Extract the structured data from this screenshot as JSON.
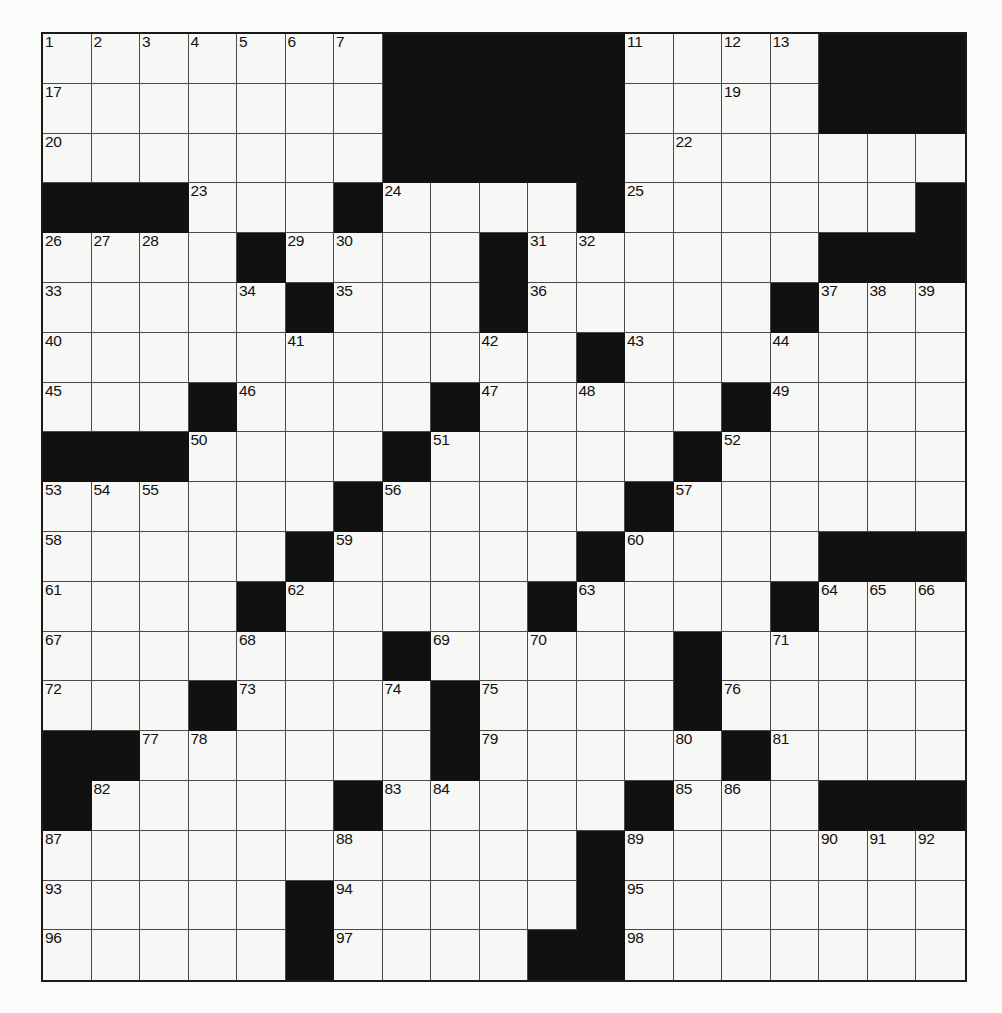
{
  "puzzle": {
    "title": "Crossword Grid",
    "type": "crossword-grid",
    "rows": 19,
    "cols": 19,
    "colors": {
      "block": "#111111",
      "cell": "#f7f7f5",
      "gridline": "#4a4a4a",
      "border": "#1a1a1a",
      "number": "#111111",
      "page_background": "#ffffff"
    },
    "blocks": [
      [
        7,
        8,
        9,
        10,
        11,
        16,
        17,
        18
      ],
      [
        7,
        8,
        9,
        10,
        11,
        16,
        17,
        18
      ],
      [
        7,
        8,
        9,
        10,
        11
      ],
      [
        0,
        1,
        2,
        6,
        11,
        18
      ],
      [
        4,
        9,
        16,
        17,
        18
      ],
      [
        5,
        9,
        15
      ],
      [
        11
      ],
      [
        3,
        8,
        14
      ],
      [
        0,
        1,
        2,
        7,
        13
      ],
      [
        6,
        12
      ],
      [
        5,
        11,
        16,
        17,
        18
      ],
      [
        4,
        10,
        15
      ],
      [
        7,
        13
      ],
      [
        3,
        8,
        13
      ],
      [
        0,
        1,
        8,
        14
      ],
      [
        0,
        6,
        12,
        16,
        17,
        18
      ],
      [
        11
      ],
      [
        5,
        11
      ],
      [
        5,
        10,
        11
      ]
    ],
    "numbers": [
      {
        "row": 0,
        "col": 0,
        "n": "1"
      },
      {
        "row": 0,
        "col": 1,
        "n": "2"
      },
      {
        "row": 0,
        "col": 2,
        "n": "3"
      },
      {
        "row": 0,
        "col": 3,
        "n": "4"
      },
      {
        "row": 0,
        "col": 4,
        "n": "5"
      },
      {
        "row": 0,
        "col": 5,
        "n": "6"
      },
      {
        "row": 0,
        "col": 6,
        "n": "7"
      },
      {
        "row": 0,
        "col": 9,
        "n": "8"
      },
      {
        "row": 0,
        "col": 10,
        "n": "9"
      },
      {
        "row": 0,
        "col": 11,
        "n": "10"
      },
      {
        "row": 0,
        "col": 12,
        "n": "11"
      },
      {
        "row": 0,
        "col": 14,
        "n": "12"
      },
      {
        "row": 0,
        "col": 15,
        "n": "13"
      },
      {
        "row": 0,
        "col": 16,
        "n": "14"
      },
      {
        "row": 0,
        "col": 17,
        "n": "15"
      },
      {
        "row": 0,
        "col": 18,
        "n": "16"
      },
      {
        "row": 1,
        "col": 0,
        "n": "17"
      },
      {
        "row": 1,
        "col": 9,
        "n": "18"
      },
      {
        "row": 1,
        "col": 14,
        "n": "19"
      },
      {
        "row": 2,
        "col": 0,
        "n": "20"
      },
      {
        "row": 2,
        "col": 9,
        "n": "21"
      },
      {
        "row": 2,
        "col": 13,
        "n": "22"
      },
      {
        "row": 3,
        "col": 3,
        "n": "23"
      },
      {
        "row": 3,
        "col": 7,
        "n": "24"
      },
      {
        "row": 3,
        "col": 12,
        "n": "25"
      },
      {
        "row": 4,
        "col": 0,
        "n": "26"
      },
      {
        "row": 4,
        "col": 1,
        "n": "27"
      },
      {
        "row": 4,
        "col": 2,
        "n": "28"
      },
      {
        "row": 4,
        "col": 5,
        "n": "29"
      },
      {
        "row": 4,
        "col": 6,
        "n": "30"
      },
      {
        "row": 4,
        "col": 10,
        "n": "31"
      },
      {
        "row": 4,
        "col": 11,
        "n": "32"
      },
      {
        "row": 5,
        "col": 0,
        "n": "33"
      },
      {
        "row": 5,
        "col": 4,
        "n": "34"
      },
      {
        "row": 5,
        "col": 6,
        "n": "35"
      },
      {
        "row": 5,
        "col": 10,
        "n": "36"
      },
      {
        "row": 5,
        "col": 16,
        "n": "37"
      },
      {
        "row": 5,
        "col": 17,
        "n": "38"
      },
      {
        "row": 5,
        "col": 18,
        "n": "39"
      },
      {
        "row": 6,
        "col": 0,
        "n": "40"
      },
      {
        "row": 6,
        "col": 5,
        "n": "41"
      },
      {
        "row": 6,
        "col": 9,
        "n": "42"
      },
      {
        "row": 6,
        "col": 12,
        "n": "43"
      },
      {
        "row": 6,
        "col": 15,
        "n": "44"
      },
      {
        "row": 7,
        "col": 0,
        "n": "45"
      },
      {
        "row": 7,
        "col": 4,
        "n": "46"
      },
      {
        "row": 7,
        "col": 9,
        "n": "47"
      },
      {
        "row": 7,
        "col": 11,
        "n": "48"
      },
      {
        "row": 7,
        "col": 15,
        "n": "49"
      },
      {
        "row": 8,
        "col": 3,
        "n": "50"
      },
      {
        "row": 8,
        "col": 8,
        "n": "51"
      },
      {
        "row": 8,
        "col": 14,
        "n": "52"
      },
      {
        "row": 9,
        "col": 0,
        "n": "53"
      },
      {
        "row": 9,
        "col": 1,
        "n": "54"
      },
      {
        "row": 9,
        "col": 2,
        "n": "55"
      },
      {
        "row": 9,
        "col": 7,
        "n": "56"
      },
      {
        "row": 9,
        "col": 13,
        "n": "57"
      },
      {
        "row": 10,
        "col": 0,
        "n": "58"
      },
      {
        "row": 10,
        "col": 6,
        "n": "59"
      },
      {
        "row": 10,
        "col": 12,
        "n": "60"
      },
      {
        "row": 11,
        "col": 0,
        "n": "61"
      },
      {
        "row": 11,
        "col": 5,
        "n": "62"
      },
      {
        "row": 11,
        "col": 11,
        "n": "63"
      },
      {
        "row": 11,
        "col": 16,
        "n": "64"
      },
      {
        "row": 11,
        "col": 17,
        "n": "65"
      },
      {
        "row": 11,
        "col": 18,
        "n": "66"
      },
      {
        "row": 12,
        "col": 0,
        "n": "67"
      },
      {
        "row": 12,
        "col": 4,
        "n": "68"
      },
      {
        "row": 12,
        "col": 8,
        "n": "69"
      },
      {
        "row": 12,
        "col": 10,
        "n": "70"
      },
      {
        "row": 12,
        "col": 15,
        "n": "71"
      },
      {
        "row": 13,
        "col": 0,
        "n": "72"
      },
      {
        "row": 13,
        "col": 4,
        "n": "73"
      },
      {
        "row": 13,
        "col": 7,
        "n": "74"
      },
      {
        "row": 13,
        "col": 9,
        "n": "75"
      },
      {
        "row": 13,
        "col": 14,
        "n": "76"
      },
      {
        "row": 14,
        "col": 2,
        "n": "77"
      },
      {
        "row": 14,
        "col": 3,
        "n": "78"
      },
      {
        "row": 14,
        "col": 9,
        "n": "79"
      },
      {
        "row": 14,
        "col": 13,
        "n": "80"
      },
      {
        "row": 14,
        "col": 15,
        "n": "81"
      },
      {
        "row": 15,
        "col": 1,
        "n": "82"
      },
      {
        "row": 15,
        "col": 7,
        "n": "83"
      },
      {
        "row": 15,
        "col": 8,
        "n": "84"
      },
      {
        "row": 15,
        "col": 13,
        "n": "85"
      },
      {
        "row": 15,
        "col": 14,
        "n": "86"
      },
      {
        "row": 16,
        "col": 0,
        "n": "87"
      },
      {
        "row": 16,
        "col": 6,
        "n": "88"
      },
      {
        "row": 16,
        "col": 12,
        "n": "89"
      },
      {
        "row": 16,
        "col": 16,
        "n": "90"
      },
      {
        "row": 16,
        "col": 17,
        "n": "91"
      },
      {
        "row": 16,
        "col": 18,
        "n": "92"
      },
      {
        "row": 17,
        "col": 0,
        "n": "93"
      },
      {
        "row": 17,
        "col": 6,
        "n": "94"
      },
      {
        "row": 17,
        "col": 12,
        "n": "95"
      },
      {
        "row": 18,
        "col": 0,
        "n": "96"
      },
      {
        "row": 18,
        "col": 6,
        "n": "97"
      },
      {
        "row": 18,
        "col": 12,
        "n": "98"
      }
    ]
  }
}
